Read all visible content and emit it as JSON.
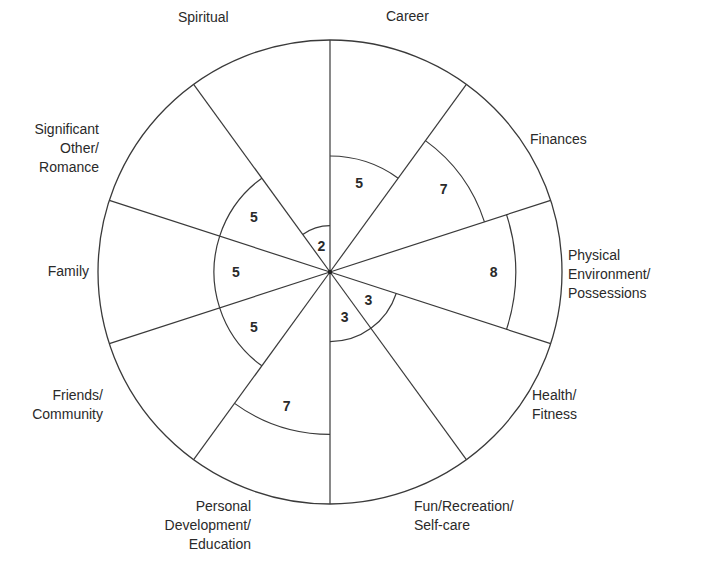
{
  "chart_data": {
    "type": "wheel",
    "scale_max": 10,
    "center": [
      330,
      272
    ],
    "radius": 232,
    "segments": [
      {
        "name": "Career",
        "value": 5
      },
      {
        "name": "Finances",
        "value": 7
      },
      {
        "name": "Physical Environment/ Possessions",
        "value": 8
      },
      {
        "name": "Health/ Fitness",
        "value": 3
      },
      {
        "name": "Fun/Recreation/ Self-care",
        "value": 3
      },
      {
        "name": "Personal Development/ Education",
        "value": 7
      },
      {
        "name": "Friends/ Community",
        "value": 5
      },
      {
        "name": "Family",
        "value": 5
      },
      {
        "name": "Significant Other/ Romance",
        "value": 5
      },
      {
        "name": "Spiritual",
        "value": 2
      }
    ]
  },
  "labels": {
    "career": [
      "Career"
    ],
    "finances": [
      "Finances"
    ],
    "physical": [
      "Physical",
      "Environment/",
      "Possessions"
    ],
    "health": [
      "Health/",
      "Fitness"
    ],
    "fun": [
      "Fun/Recreation/",
      "Self-care"
    ],
    "personal": [
      "Personal",
      "Development/",
      "Education"
    ],
    "friends": [
      "Friends/",
      "Community"
    ],
    "family": [
      "Family"
    ],
    "significant": [
      "Significant",
      "Other/",
      "Romance"
    ],
    "spiritual": [
      "Spiritual"
    ]
  },
  "colors": {
    "line": "#3a3a3a",
    "text": "#2a2a2a",
    "background": "#ffffff"
  }
}
